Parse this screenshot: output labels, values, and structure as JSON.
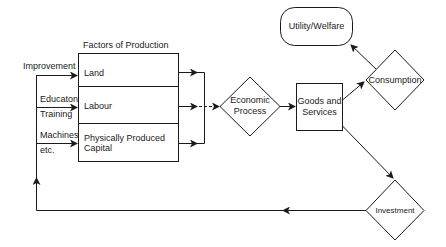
{
  "diagram": {
    "factors_title": "Factors of Production",
    "factors": [
      {
        "label": "Land",
        "input": [
          "Improvement"
        ]
      },
      {
        "label": "Labour",
        "input": [
          "Educaton",
          "Training"
        ]
      },
      {
        "label": "Physically Produced Capital",
        "label_lines": [
          "Physically Produced",
          "Capital"
        ],
        "input": [
          "Machines",
          "etc."
        ]
      }
    ],
    "nodes": {
      "economic_process": [
        "Economic",
        "Process"
      ],
      "goods_services": [
        "Goods and",
        "Services"
      ],
      "utility_welfare": "Utility/Welfare",
      "consumption": "Consumption",
      "investment": "Investment"
    },
    "edges": [
      {
        "from": "Improvement",
        "to": "Land"
      },
      {
        "from": "Educaton/Training",
        "to": "Labour"
      },
      {
        "from": "Machines etc.",
        "to": "Physically Produced Capital"
      },
      {
        "from": "Factors of Production",
        "to": "Economic Process"
      },
      {
        "from": "Economic Process",
        "to": "Goods and Services"
      },
      {
        "from": "Goods and Services",
        "to": "Consumption"
      },
      {
        "from": "Consumption",
        "to": "Utility/Welfare"
      },
      {
        "from": "Goods and Services",
        "to": "Investment"
      },
      {
        "from": "Investment",
        "to": "Factors of Production inputs"
      }
    ]
  }
}
